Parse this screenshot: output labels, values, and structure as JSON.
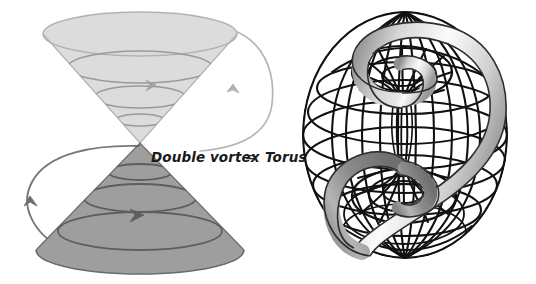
{
  "figure": {
    "background_color": "#ffffff",
    "width": 536,
    "height": 284
  },
  "labels": {
    "left_term": "Double vortex",
    "operator": "=",
    "right_term": "Torus"
  },
  "left_diagram": {
    "name": "double-vortex",
    "upper_cone": {
      "label": "upper-cone",
      "fill_color": "#dcdcdc",
      "stroke_color": "#a8a8a8",
      "orientation": "apex-down",
      "spiral_turns": 3
    },
    "lower_cone": {
      "label": "lower-cone",
      "fill_color": "#9e9e9e",
      "stroke_color": "#707070",
      "orientation": "apex-up",
      "spiral_turns": 3
    },
    "flow_lines": [
      {
        "label": "right-flow-line",
        "color": "#b0b0b0",
        "arrow_direction": "down"
      },
      {
        "label": "left-flow-line",
        "color": "#6e6e6e",
        "arrow_direction": "up"
      }
    ]
  },
  "right_diagram": {
    "name": "torus",
    "mesh_color": "#111111",
    "ribbon_fill_light": "#fdfdfd",
    "ribbon_fill_mid": "#b9b9b9",
    "ribbon_fill_dark": "#8a8a8a",
    "ribbon_stroke": "#2a2a2a",
    "vortex_count": 2,
    "meridian_count": 16,
    "parallel_count": 9
  }
}
